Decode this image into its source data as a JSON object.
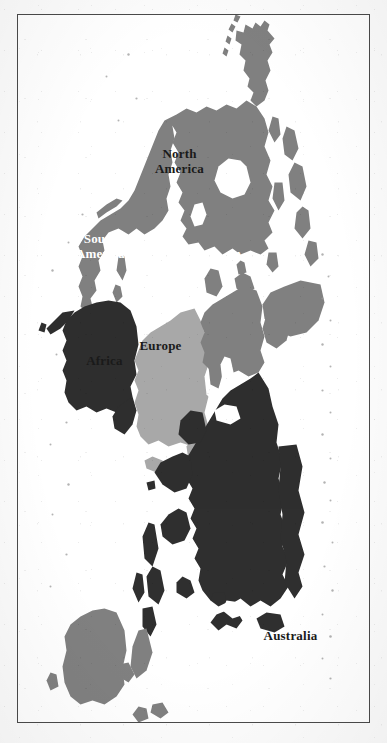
{
  "document": {
    "kind": "world-map",
    "orientation": "rotated-90-clockwise",
    "background_color": "#ffffff",
    "frame_color": "#4a4a4a",
    "ocean_color": "#ffffff"
  },
  "legend": {
    "shade_dark_label": "dark gray",
    "shade_dark_color": "#2f2f2f",
    "shade_mid_label": "medium gray",
    "shade_mid_color": "#808080",
    "shade_light_label": "light gray",
    "shade_light_color": "#a8a8a8"
  },
  "map": {
    "type": "choropleth-continents",
    "labels": [
      {
        "id": "asia",
        "text": "Asia",
        "shade": "dark",
        "fill": "#2f2f2f",
        "text_color": "#ffffff",
        "font_size": 13,
        "x": 243,
        "y": 122
      },
      {
        "id": "australia",
        "text": "Australia",
        "shade": "mid",
        "fill": "#808080",
        "text_color": "#1a1a1a",
        "font_size": 13,
        "x": 623,
        "y": 78
      },
      {
        "id": "europe",
        "text": "Europe",
        "shade": "mid",
        "fill": "#808080",
        "text_color": "#1a1a1a",
        "font_size": 13,
        "x": 333,
        "y": 208
      },
      {
        "id": "africa",
        "text": "Africa",
        "shade": "light",
        "fill": "#a8a8a8",
        "text_color": "#1a1a1a",
        "font_size": 13,
        "x": 348,
        "y": 264
      },
      {
        "id": "north-america",
        "text": "North America",
        "shade": "mid",
        "fill": "#808080",
        "text_color": "#1a1a1a",
        "font_size": 13,
        "x": 148,
        "y": 189,
        "lines": [
          "North",
          "America"
        ]
      },
      {
        "id": "south-america",
        "text": "South America",
        "shade": "dark",
        "fill": "#2f2f2f",
        "text_color": "#ffffff",
        "font_size": 13,
        "x": 233,
        "y": 268,
        "lines": [
          "South",
          "America"
        ]
      }
    ],
    "continents": [
      {
        "id": "asia",
        "name": "Asia",
        "shade": "dark"
      },
      {
        "id": "europe",
        "name": "Europe",
        "shade": "mid"
      },
      {
        "id": "africa",
        "name": "Africa",
        "shade": "light"
      },
      {
        "id": "north-america",
        "name": "North America",
        "shade": "mid"
      },
      {
        "id": "south-america",
        "name": "South America",
        "shade": "dark"
      },
      {
        "id": "australia",
        "name": "Australia",
        "shade": "mid"
      },
      {
        "id": "antarctica",
        "name": "Antarctica",
        "shade": "none"
      }
    ]
  }
}
